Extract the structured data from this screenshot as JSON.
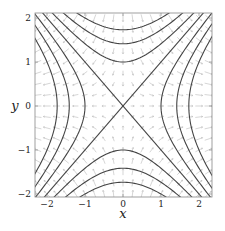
{
  "chart_data": {
    "type": "line",
    "subtype": "contour_with_vector_field",
    "title": "",
    "xlabel": "x",
    "ylabel": "y",
    "xlim": [
      -2.3,
      2.3
    ],
    "ylim": [
      -2.1,
      2.1
    ],
    "xticks": [
      -2,
      -1,
      0,
      1,
      2
    ],
    "yticks": [
      -2,
      -1,
      0,
      1,
      2
    ],
    "xtick_labels": [
      "−2",
      "−1",
      "0",
      "1",
      "2"
    ],
    "ytick_labels": [
      "−2",
      "−1",
      "0",
      "1",
      "2"
    ],
    "grid": false,
    "legend": null,
    "contour_function": "x^2 - y^2",
    "contour_levels": [
      -3,
      -2,
      -1,
      0,
      1,
      2,
      3
    ],
    "series": [
      {
        "name": "x^2 - y^2 = 3",
        "vertex": [
          1.732,
          0
        ]
      },
      {
        "name": "x^2 - y^2 = 2",
        "vertex": [
          1.414,
          0
        ]
      },
      {
        "name": "x^2 - y^2 = 1",
        "vertex": [
          1.0,
          0
        ]
      },
      {
        "name": "x^2 - y^2 = 0",
        "lines": [
          "y = x",
          "y = -x"
        ]
      },
      {
        "name": "x^2 - y^2 = -1",
        "vertex": [
          0,
          1.0
        ]
      },
      {
        "name": "x^2 - y^2 = -2",
        "vertex": [
          0,
          1.414
        ]
      },
      {
        "name": "x^2 - y^2 = -3",
        "vertex": [
          0,
          1.732
        ]
      }
    ],
    "vector_field": {
      "description": "faint gray arrow grid, gradient of x^2 - y^2",
      "u": "2x",
      "v": "-2y",
      "grid_step": 0.25,
      "color": "#b8b8b8"
    },
    "colors": {
      "contour": "#444444",
      "axes": "#888888",
      "arrows": "#bbbbbb"
    }
  }
}
